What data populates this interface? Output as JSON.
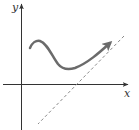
{
  "diagram": {
    "axes": {
      "x_label": "x",
      "y_label": "y",
      "color": "#333333"
    },
    "curve": {
      "color": "#6b6b6b",
      "has_arrow": true,
      "features": [
        "local maximum near left",
        "local minimum",
        "approaches asymptote from above"
      ]
    },
    "asymptote": {
      "style": "dashed",
      "color": "#8a8a8a",
      "type": "oblique"
    }
  }
}
